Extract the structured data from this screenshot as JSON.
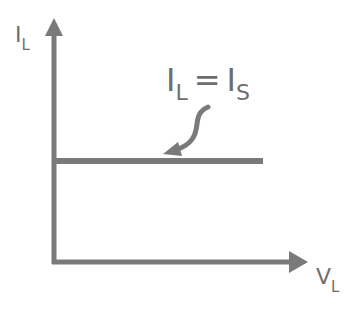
{
  "diagram": {
    "type": "IV characteristic",
    "y_axis": {
      "label_main": "I",
      "label_sub": "L"
    },
    "x_axis": {
      "label_main": "V",
      "label_sub": "L"
    },
    "annotation": {
      "lhs_main": "I",
      "lhs_sub": "L",
      "equals": "=",
      "rhs_main": "I",
      "rhs_sub": "S"
    },
    "colors": {
      "stroke": "#7a7a7a",
      "text": "#6e6e6e",
      "background": "#ffffff"
    }
  }
}
